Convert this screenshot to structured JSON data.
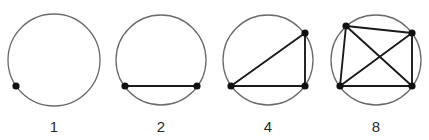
{
  "figure": {
    "panels": [
      {
        "label": "1",
        "circle": {
          "cx": 54,
          "cy": 60,
          "r": 46
        },
        "points": [
          [
            16,
            86
          ]
        ],
        "chords": []
      },
      {
        "label": "2",
        "circle": {
          "cx": 161,
          "cy": 60,
          "r": 45
        },
        "points": [
          [
            125,
            86
          ],
          [
            197,
            86
          ]
        ],
        "chords": [
          [
            0,
            1
          ]
        ]
      },
      {
        "label": "4",
        "circle": {
          "cx": 268,
          "cy": 60,
          "r": 45
        },
        "points": [
          [
            231,
            86
          ],
          [
            305,
            86
          ],
          [
            305,
            33
          ]
        ],
        "chords": [
          [
            0,
            1
          ],
          [
            1,
            2
          ],
          [
            0,
            2
          ]
        ]
      },
      {
        "label": "8",
        "circle": {
          "cx": 376,
          "cy": 60,
          "r": 45
        },
        "points": [
          [
            346,
            26
          ],
          [
            412,
            33
          ],
          [
            340,
            86
          ],
          [
            412,
            86
          ]
        ],
        "chords": [
          [
            0,
            1
          ],
          [
            0,
            2
          ],
          [
            0,
            3
          ],
          [
            1,
            2
          ],
          [
            1,
            3
          ],
          [
            2,
            3
          ]
        ]
      }
    ],
    "label_y": 127,
    "colors": {
      "circle": "#6a6a6a",
      "chord": "#1a1a1a",
      "point": "#111111",
      "label": "#2a2a2a"
    }
  }
}
